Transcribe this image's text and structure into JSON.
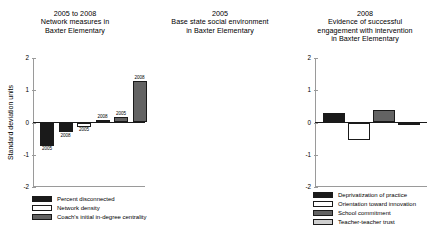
{
  "figure": {
    "ylabel": "Standard deviation units"
  },
  "chart_data": [
    {
      "type": "bar",
      "title": "2005 to 2008",
      "subtitle": "Network measures in Baxter Elementary",
      "title_lines": [
        "2005 to 2008",
        "Network measures in",
        "Baxter Elementary"
      ],
      "ylabel": "Standard deviation units",
      "xlabel": "",
      "ylim": [
        -2,
        2
      ],
      "yticks": [
        2,
        1,
        0,
        -1,
        -2
      ],
      "yticklabels": [
        "2",
        "1",
        "0",
        "-1",
        "-2"
      ],
      "grid": false,
      "legend_position": "below",
      "categories": [
        "Percent disconnected 2005",
        "Percent disconnected 2008",
        "Network density 2005",
        "Network density 2008",
        "Coach's centrality 2005",
        "Coach's centrality 2008"
      ],
      "values": [
        -0.72,
        -0.3,
        -0.13,
        0.08,
        0.17,
        1.3
      ],
      "point_labels": [
        "2005",
        "2008",
        "2005",
        "2008",
        "2005",
        "2008"
      ],
      "bar_styles": [
        "black",
        "black",
        "white",
        "white",
        "darkgray",
        "darkgray"
      ],
      "series": [
        {
          "name": "Percent disconnected",
          "values": [
            -0.72,
            -0.3
          ],
          "years": [
            "2005",
            "2008"
          ],
          "style": "black"
        },
        {
          "name": "Network density",
          "values": [
            -0.13,
            0.08
          ],
          "years": [
            "2005",
            "2008"
          ],
          "style": "white"
        },
        {
          "name": "Coach's initial in-degree centrality",
          "values": [
            0.17,
            1.3
          ],
          "years": [
            "2005",
            "2008"
          ],
          "style": "darkgray"
        }
      ],
      "legend": [
        {
          "label": "Percent disconnected",
          "style": "black"
        },
        {
          "label": "Network density",
          "style": "white"
        },
        {
          "label": "Coach's initial in-degree centrality",
          "style": "darkgray"
        }
      ]
    },
    {
      "type": "bar",
      "title": "2005",
      "subtitle": "Base state social environment in Baxter Elementary",
      "title_lines": [
        "2005",
        "Base state social environment",
        "in Baxter Elementary"
      ],
      "ylabel": "",
      "xlabel": "",
      "ylim": [
        -2,
        2
      ],
      "yticks": [
        2,
        1,
        0,
        -1,
        -2
      ],
      "yticklabels": [
        "2",
        "1",
        "0",
        "-1",
        "-2"
      ],
      "grid": false,
      "legend_position": "below",
      "categories": [
        "Deprivatization of practice",
        "Orientation toward innovation",
        "School commitment",
        "Teacher-teacher trust"
      ],
      "values": [
        0.28,
        -0.55,
        0.4,
        -0.06
      ],
      "bar_styles": [
        "black",
        "white",
        "darkgray",
        "lightgray"
      ],
      "legend": [
        {
          "label": "Deprivatization of practice",
          "style": "black"
        },
        {
          "label": "Orientation toward innovation",
          "style": "white"
        },
        {
          "label": "School commitment",
          "style": "darkgray"
        },
        {
          "label": "Teacher-teacher trust",
          "style": "lightgray"
        }
      ]
    },
    {
      "type": "bar",
      "title": "2008",
      "subtitle": "Evidence of successful engagement with intervention in Baxter Elementary",
      "title_lines": [
        "2008",
        "Evidence of successful",
        "engagement with intervention",
        "in Baxter Elementary"
      ],
      "ylabel": "",
      "xlabel": "",
      "ylim": [
        -2,
        2
      ],
      "yticks": [
        2,
        1,
        0,
        -1,
        -2
      ],
      "yticklabels": [
        "2",
        "1",
        "0",
        "-1",
        "-2"
      ],
      "grid": false,
      "legend_position": "below",
      "categories": [
        "Avg. # coaching sessions per teacher",
        "Quality of working relations with coach",
        "Growth in teachers' value added",
        "Average teacher efficacy"
      ],
      "values": [
        0.3,
        -0.17,
        0.35,
        0.62
      ],
      "bar_styles": [
        "black",
        "white",
        "darkgray",
        "lightgray"
      ],
      "legend": [
        {
          "label": "Avg. # coaching sessions per teacher",
          "style": "black"
        },
        {
          "label": "Quality of working relations with coach",
          "style": "white"
        },
        {
          "label": "Growth in teachers' value added",
          "style": "darkgray"
        },
        {
          "label": "Average teacher efficacy",
          "style": "lightgray"
        }
      ]
    }
  ],
  "colors": {
    "black": "#1a1a1a",
    "white": "#ffffff",
    "darkgray": "#636363",
    "lightgray": "#cfcfcf",
    "axis": "#9a9a9a",
    "zeroline": "#1a1a1a",
    "edge": "#1a1a1a"
  }
}
